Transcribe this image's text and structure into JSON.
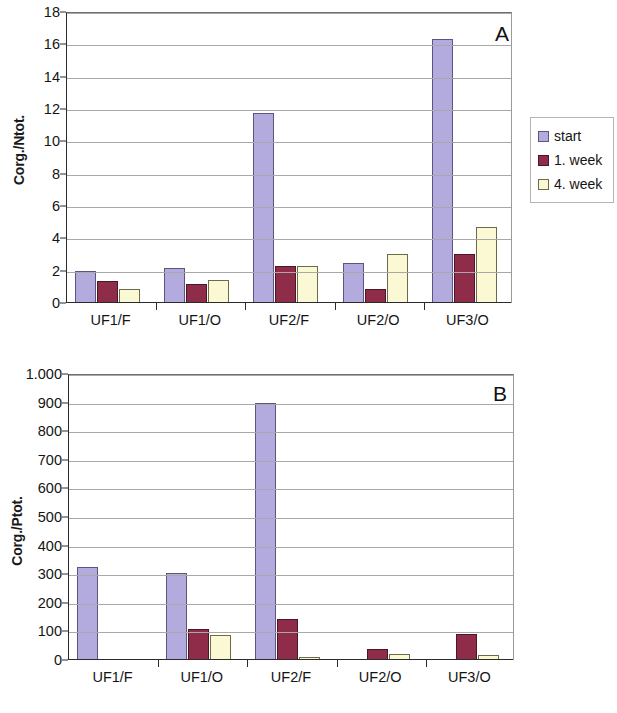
{
  "figure": {
    "panels": [
      {
        "letter": "A",
        "ylabel": "Corg./Ntot."
      },
      {
        "letter": "B",
        "ylabel": "Corg./Ptot."
      }
    ]
  },
  "legend": {
    "position": "right",
    "entries": [
      {
        "label": "start",
        "color": "#b3aadd",
        "key": "start"
      },
      {
        "label": "1. week",
        "color": "#8e2c49",
        "key": "w1"
      },
      {
        "label": "4. week",
        "color": "#fbf8d4",
        "key": "w4"
      }
    ]
  },
  "chart_data": [
    {
      "type": "bar",
      "panel": "A",
      "title": "",
      "xlabel": "",
      "ylabel": "Corg./Ntot.",
      "categories": [
        "UF1/F",
        "UF1/O",
        "UF2/F",
        "UF2/O",
        "UF3/O"
      ],
      "series": [
        {
          "name": "start",
          "color": "#b3aadd",
          "values": [
            1.95,
            2.15,
            11.75,
            2.45,
            16.3
          ]
        },
        {
          "name": "1. week",
          "color": "#8e2c49",
          "values": [
            1.35,
            1.2,
            2.3,
            0.85,
            3.05
          ]
        },
        {
          "name": "4. week",
          "color": "#fbf8d4",
          "values": [
            0.85,
            1.45,
            2.3,
            3.05,
            4.7
          ]
        }
      ],
      "ylim": [
        0,
        18
      ],
      "ytick_step": 2,
      "yticks": [
        0,
        2,
        4,
        6,
        8,
        10,
        12,
        14,
        16,
        18
      ],
      "ytick_labels": [
        "0",
        "2",
        "4",
        "6",
        "8",
        "10",
        "12",
        "14",
        "16",
        "18"
      ],
      "grid": true,
      "legend_position": "right"
    },
    {
      "type": "bar",
      "panel": "B",
      "title": "",
      "xlabel": "",
      "ylabel": "Corg./Ptot.",
      "categories": [
        "UF1/F",
        "UF1/O",
        "UF2/F",
        "UF2/O",
        "UF3/O"
      ],
      "series": [
        {
          "name": "start",
          "color": "#b3aadd",
          "values": [
            325,
            305,
            900,
            0,
            0
          ]
        },
        {
          "name": "1. week",
          "color": "#8e2c49",
          "values": [
            0,
            110,
            145,
            38,
            92
          ]
        },
        {
          "name": "4. week",
          "color": "#fbf8d4",
          "values": [
            0,
            88,
            10,
            22,
            18
          ]
        }
      ],
      "ylim": [
        0,
        1000
      ],
      "ytick_step": 100,
      "yticks": [
        0,
        100,
        200,
        300,
        400,
        500,
        600,
        700,
        800,
        900,
        1000
      ],
      "ytick_labels": [
        "0",
        "100",
        "200",
        "300",
        "400",
        "500",
        "600",
        "700",
        "800",
        "900",
        "1.000"
      ],
      "grid": true,
      "legend_position": "right"
    }
  ]
}
